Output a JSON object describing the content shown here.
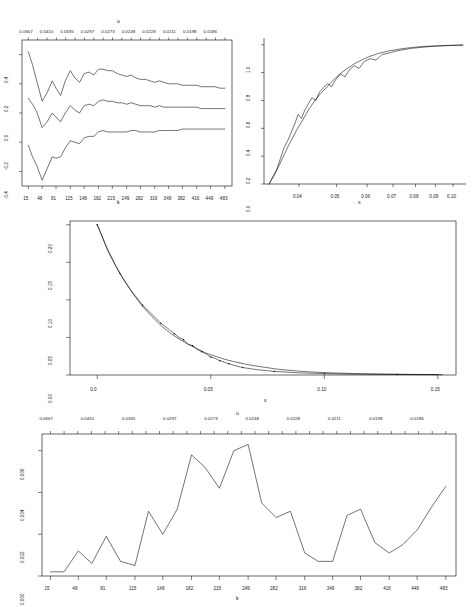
{
  "figure": {
    "title": "",
    "background": "#ffffff",
    "line_color": "#000000",
    "width": 476,
    "height": 607
  },
  "chart_data": [
    {
      "id": "panel-1",
      "type": "line",
      "title": "",
      "xlabel": "k",
      "ylabel": "",
      "top_axis_label": "u",
      "xlim": [
        0,
        500
      ],
      "ylim": [
        -0.5,
        0.5
      ],
      "grid": false,
      "legend": "none",
      "xticks": [
        15,
        48,
        81,
        115,
        148,
        182,
        215,
        249,
        282,
        316,
        349,
        382,
        416,
        449,
        483
      ],
      "xticklabels": [
        "15",
        "48",
        "81",
        "115",
        "148",
        "182",
        "215",
        "249",
        "282",
        "316",
        "349",
        "382",
        "416",
        "449",
        "483"
      ],
      "yticks": [
        -0.4,
        -0.2,
        0.0,
        0.2,
        0.4
      ],
      "yticklabels": [
        "-0.4",
        "-0.2",
        "0.0",
        "0.2",
        "0.4"
      ],
      "top_ticklabels": [
        "0.0667",
        "0.0410",
        "0.0335",
        "0.0297",
        "0.0273",
        "0.0248",
        "0.0228",
        "0.0211",
        "0.0198",
        "0.0186"
      ],
      "series": [
        {
          "name": "upper confidence band",
          "x": [
            15,
            25,
            35,
            48,
            60,
            72,
            81,
            92,
            103,
            115,
            126,
            137,
            148,
            160,
            171,
            182,
            193,
            204,
            215,
            227,
            238,
            249,
            260,
            271,
            282,
            294,
            305,
            316,
            327,
            338,
            349,
            360,
            371,
            382,
            394,
            405,
            416,
            427,
            438,
            449,
            460,
            471,
            483
          ],
          "values": [
            0.42,
            0.33,
            0.22,
            0.08,
            0.14,
            0.22,
            0.17,
            0.12,
            0.22,
            0.29,
            0.24,
            0.21,
            0.27,
            0.28,
            0.26,
            0.3,
            0.3,
            0.29,
            0.29,
            0.27,
            0.26,
            0.25,
            0.26,
            0.24,
            0.23,
            0.23,
            0.22,
            0.21,
            0.22,
            0.21,
            0.2,
            0.2,
            0.2,
            0.19,
            0.19,
            0.19,
            0.19,
            0.18,
            0.18,
            0.18,
            0.18,
            0.17,
            0.17
          ]
        },
        {
          "name": "point estimate",
          "x": [
            15,
            25,
            35,
            48,
            60,
            72,
            81,
            92,
            103,
            115,
            126,
            137,
            148,
            160,
            171,
            182,
            193,
            204,
            215,
            227,
            238,
            249,
            260,
            271,
            282,
            294,
            305,
            316,
            327,
            338,
            349,
            360,
            371,
            382,
            394,
            405,
            416,
            427,
            438,
            449,
            460,
            471,
            483
          ],
          "values": [
            0.1,
            0.06,
            0.01,
            -0.1,
            -0.06,
            0.0,
            -0.03,
            -0.06,
            0.0,
            0.05,
            0.02,
            0.0,
            0.05,
            0.06,
            0.05,
            0.08,
            0.09,
            0.08,
            0.08,
            0.07,
            0.07,
            0.06,
            0.07,
            0.06,
            0.05,
            0.05,
            0.05,
            0.04,
            0.05,
            0.04,
            0.04,
            0.04,
            0.04,
            0.04,
            0.04,
            0.04,
            0.04,
            0.03,
            0.03,
            0.03,
            0.03,
            0.03,
            0.03
          ]
        },
        {
          "name": "lower confidence band",
          "x": [
            15,
            25,
            35,
            48,
            60,
            72,
            81,
            92,
            103,
            115,
            126,
            137,
            148,
            160,
            171,
            182,
            193,
            204,
            215,
            227,
            238,
            249,
            260,
            271,
            282,
            294,
            305,
            316,
            327,
            338,
            349,
            360,
            371,
            382,
            394,
            405,
            416,
            427,
            438,
            449,
            460,
            471,
            483
          ],
          "values": [
            -0.22,
            -0.3,
            -0.36,
            -0.46,
            -0.38,
            -0.3,
            -0.31,
            -0.3,
            -0.24,
            -0.19,
            -0.2,
            -0.21,
            -0.17,
            -0.16,
            -0.16,
            -0.13,
            -0.12,
            -0.13,
            -0.13,
            -0.13,
            -0.13,
            -0.13,
            -0.12,
            -0.12,
            -0.13,
            -0.13,
            -0.13,
            -0.13,
            -0.12,
            -0.12,
            -0.12,
            -0.12,
            -0.12,
            -0.11,
            -0.11,
            -0.11,
            -0.11,
            -0.11,
            -0.11,
            -0.11,
            -0.11,
            -0.11,
            -0.11
          ]
        }
      ]
    },
    {
      "id": "panel-2",
      "type": "line",
      "title": "",
      "xlabel": "x",
      "ylabel": "",
      "xlim": [
        0.032,
        0.108
      ],
      "ylim": [
        0.0,
        1.0
      ],
      "grid": false,
      "legend": "none",
      "xticks": [
        0.04,
        0.05,
        0.06,
        0.07,
        0.08,
        0.09,
        0.1
      ],
      "xticklabels": [
        "0.04",
        "0.05",
        "0.06",
        "0.07",
        "0.08",
        "0.09",
        "0.10"
      ],
      "yticks": [
        0.0,
        0.2,
        0.4,
        0.6,
        0.8,
        1.0
      ],
      "yticklabels": [
        "0.0",
        "0.2",
        "0.4",
        "0.6",
        "0.8",
        "1.0"
      ],
      "series": [
        {
          "name": "fitted distribution",
          "x": [
            0.0335,
            0.0345,
            0.0355,
            0.0365,
            0.0375,
            0.0385,
            0.0395,
            0.0405,
            0.0415,
            0.0425,
            0.044,
            0.0455,
            0.047,
            0.049,
            0.051,
            0.053,
            0.0555,
            0.058,
            0.061,
            0.0645,
            0.0685,
            0.073,
            0.078,
            0.084,
            0.09,
            0.096,
            0.102,
            0.106
          ],
          "values": [
            0.0,
            0.06,
            0.13,
            0.2,
            0.27,
            0.33,
            0.39,
            0.44,
            0.49,
            0.54,
            0.6,
            0.65,
            0.69,
            0.745,
            0.79,
            0.825,
            0.862,
            0.89,
            0.917,
            0.94,
            0.957,
            0.97,
            0.98,
            0.988,
            0.992,
            0.995,
            0.997,
            0.998
          ]
        },
        {
          "name": "empirical distribution",
          "x": [
            0.0335,
            0.0342,
            0.035,
            0.0358,
            0.0366,
            0.0374,
            0.0382,
            0.039,
            0.0398,
            0.0406,
            0.0414,
            0.0422,
            0.0432,
            0.0442,
            0.0452,
            0.0462,
            0.0474,
            0.0486,
            0.0498,
            0.0512,
            0.0526,
            0.054,
            0.0556,
            0.0572,
            0.059,
            0.061,
            0.0632,
            0.0656,
            0.0682,
            0.0712,
            0.0746,
            0.0786,
            0.0832,
            0.0888,
            0.095,
            0.101,
            0.106
          ],
          "values": [
            0.0,
            0.05,
            0.1,
            0.18,
            0.26,
            0.31,
            0.37,
            0.43,
            0.5,
            0.47,
            0.53,
            0.57,
            0.62,
            0.6,
            0.66,
            0.69,
            0.72,
            0.7,
            0.75,
            0.79,
            0.77,
            0.82,
            0.85,
            0.83,
            0.88,
            0.9,
            0.89,
            0.93,
            0.94,
            0.955,
            0.965,
            0.975,
            0.982,
            0.989,
            0.993,
            0.996,
            0.998
          ]
        }
      ]
    },
    {
      "id": "panel-3",
      "type": "line",
      "title": "",
      "xlabel": "x",
      "ylabel": "",
      "xlim": [
        -0.012,
        0.158
      ],
      "ylim": [
        0.0,
        0.205
      ],
      "grid": false,
      "legend": "none",
      "xticks": [
        0.0,
        0.05,
        0.1,
        0.15
      ],
      "xticklabels": [
        "0.0",
        "0.05",
        "0.10",
        "0.15"
      ],
      "yticks": [
        0.0,
        0.05,
        0.1,
        0.15,
        0.2
      ],
      "yticklabels": [
        "0.00",
        "0.05",
        "0.10",
        "0.15",
        "0.20"
      ],
      "series": [
        {
          "name": "fitted tail",
          "x": [
            0.0,
            0.004,
            0.008,
            0.012,
            0.016,
            0.02,
            0.024,
            0.028,
            0.032,
            0.036,
            0.04,
            0.044,
            0.048,
            0.052,
            0.056,
            0.06,
            0.066,
            0.072,
            0.08,
            0.09,
            0.1,
            0.112,
            0.125,
            0.14,
            0.152
          ],
          "values": [
            0.2,
            0.171,
            0.146,
            0.125,
            0.107,
            0.091,
            0.078,
            0.066,
            0.056,
            0.048,
            0.041,
            0.035,
            0.029,
            0.025,
            0.021,
            0.018,
            0.014,
            0.011,
            0.0075,
            0.0048,
            0.0032,
            0.002,
            0.0013,
            0.0008,
            0.0005
          ]
        },
        {
          "name": "empirical tail",
          "x": [
            0.0,
            0.005,
            0.01,
            0.015,
            0.02,
            0.024,
            0.028,
            0.031,
            0.034,
            0.036,
            0.038,
            0.04,
            0.042,
            0.044,
            0.046,
            0.048,
            0.05,
            0.052,
            0.054,
            0.056,
            0.058,
            0.06,
            0.064,
            0.07,
            0.078,
            0.088,
            0.1,
            0.115,
            0.132,
            0.15
          ],
          "values": [
            0.2,
            0.163,
            0.135,
            0.112,
            0.093,
            0.081,
            0.069,
            0.062,
            0.055,
            0.05,
            0.047,
            0.041,
            0.039,
            0.034,
            0.031,
            0.028,
            0.024,
            0.022,
            0.019,
            0.017,
            0.015,
            0.013,
            0.01,
            0.0072,
            0.0048,
            0.003,
            0.0018,
            0.0011,
            0.0007,
            0.0004
          ]
        }
      ]
    },
    {
      "id": "panel-4",
      "type": "line",
      "title": "",
      "xlabel": "k",
      "ylabel": "",
      "top_axis_label": "u",
      "xlim": [
        0,
        500
      ],
      "ylim": [
        0.0,
        0.0068
      ],
      "grid": false,
      "legend": "none",
      "xticks": [
        15,
        48,
        81,
        115,
        148,
        182,
        215,
        249,
        282,
        316,
        349,
        382,
        416,
        449,
        483
      ],
      "xticklabels": [
        "15",
        "48",
        "81",
        "115",
        "148",
        "182",
        "215",
        "249",
        "282",
        "316",
        "349",
        "382",
        "416",
        "449",
        "483"
      ],
      "yticks": [
        0.0,
        0.002,
        0.004,
        0.006
      ],
      "yticklabels": [
        "0.000",
        "0.002",
        "0.004",
        "0.006"
      ],
      "top_ticklabels": [
        "0.0667",
        "0.0410",
        "0.0335",
        "0.0297",
        "0.0273",
        "0.0248",
        "0.0228",
        "0.0211",
        "0.0198",
        "0.0186"
      ],
      "series": [
        {
          "name": "diagnostic statistic",
          "x": [
            15,
            31,
            48,
            64,
            81,
            98,
            115,
            131,
            148,
            165,
            182,
            198,
            215,
            232,
            249,
            265,
            282,
            299,
            316,
            332,
            349,
            366,
            382,
            399,
            416,
            432,
            449,
            466,
            483
          ],
          "values": [
            0.0002,
            0.0002,
            0.0012,
            0.0006,
            0.0019,
            0.0007,
            0.0005,
            0.0031,
            0.002,
            0.0032,
            0.0058,
            0.0052,
            0.0042,
            0.006,
            0.0063,
            0.0035,
            0.0028,
            0.0031,
            0.0011,
            0.0007,
            0.0007,
            0.0029,
            0.0032,
            0.0016,
            0.0011,
            0.0015,
            0.0022,
            0.0033,
            0.0043
          ]
        }
      ]
    }
  ],
  "panels": {
    "p1": {
      "xlabel": "k",
      "top_label": "u",
      "yticklabels": [
        "0.4",
        "0.2",
        "0.0",
        "-0.2",
        "-0.4"
      ],
      "xticklabels": [
        "15",
        "48",
        "81",
        "115",
        "148",
        "182",
        "215",
        "249",
        "282",
        "316",
        "349",
        "382",
        "416",
        "449",
        "483"
      ],
      "topticklabels": [
        "0.0667",
        "0.0410",
        "0.0335",
        "0.0297",
        "0.0273",
        "0.0248",
        "0.0228",
        "0.0211",
        "0.0198",
        "0.0186"
      ]
    },
    "p2": {
      "xlabel": "x",
      "yticklabels": [
        "1.0",
        "0.8",
        "0.6",
        "0.4",
        "0.2",
        "0.0"
      ],
      "xticklabels": [
        "0.04",
        "0.05",
        "0.06",
        "0.07",
        "0.08",
        "0.09",
        "0.10"
      ]
    },
    "p3": {
      "xlabel": "x",
      "yticklabels": [
        "0.20",
        "0.15",
        "0.10",
        "0.05",
        "0.00"
      ],
      "xticklabels": [
        "0.0",
        "0.05",
        "0.10",
        "0.15"
      ]
    },
    "p4": {
      "xlabel": "k",
      "top_label": "u",
      "yticklabels": [
        "0.006",
        "0.004",
        "0.002",
        "0.000"
      ],
      "xticklabels": [
        "15",
        "48",
        "81",
        "115",
        "148",
        "182",
        "215",
        "249",
        "282",
        "316",
        "349",
        "382",
        "416",
        "449",
        "483"
      ],
      "topticklabels": [
        "0.0667",
        "0.0410",
        "0.0335",
        "0.0297",
        "0.0273",
        "0.0248",
        "0.0228",
        "0.0211",
        "0.0198",
        "0.0186"
      ]
    }
  }
}
